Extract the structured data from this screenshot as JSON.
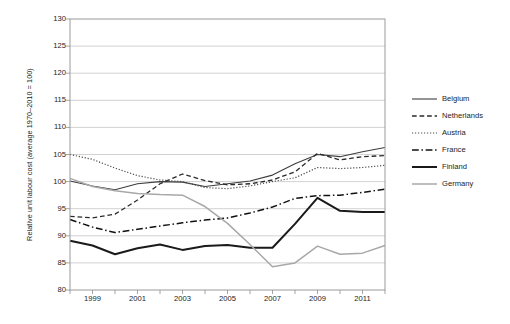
{
  "chart_data": {
    "type": "line",
    "title": "",
    "xlabel": "",
    "ylabel": "Relative unit labour cost (average 1970–2010 = 100)",
    "ylim": [
      80,
      130
    ],
    "ytick_step": 5,
    "yticks": [
      130,
      125,
      120,
      115,
      110,
      105,
      100,
      95,
      90,
      85,
      80
    ],
    "xlim": [
      1998,
      2012
    ],
    "x": [
      1998,
      1999,
      2000,
      2001,
      2002,
      2003,
      2004,
      2005,
      2006,
      2007,
      2008,
      2009,
      2010,
      2011,
      2012
    ],
    "xticks_labeled": [
      1999,
      2001,
      2003,
      2005,
      2007,
      2009,
      2011
    ],
    "xticks_all": [
      1998,
      1999,
      2000,
      2001,
      2002,
      2003,
      2004,
      2005,
      2006,
      2007,
      2008,
      2009,
      2010,
      2011,
      2012
    ],
    "grid": "horizontal",
    "legend_position": "right",
    "series": [
      {
        "name": "Belgium",
        "color": "#3d3d3d",
        "style": "solid",
        "width": 1.1,
        "values": [
          100.1,
          99.2,
          98.5,
          99.6,
          100.0,
          99.9,
          99.1,
          99.6,
          100.1,
          101.2,
          103.3,
          105.0,
          104.6,
          105.5,
          106.3
        ]
      },
      {
        "name": "Netherlands",
        "color": "#2a2a2a",
        "style": "dashed",
        "width": 1.3,
        "values": [
          93.6,
          93.3,
          94.0,
          96.6,
          99.6,
          101.4,
          100.2,
          99.4,
          99.6,
          100.3,
          101.8,
          105.2,
          104.0,
          104.6,
          104.8
        ]
      },
      {
        "name": "Austria",
        "color": "#4a4a4a",
        "style": "dotted",
        "width": 1.2,
        "values": [
          105.0,
          104.1,
          102.5,
          101.1,
          100.3,
          100.0,
          98.9,
          98.7,
          99.2,
          100.0,
          100.7,
          102.6,
          102.4,
          102.6,
          103.0
        ]
      },
      {
        "name": "France",
        "color": "#111111",
        "style": "dashdot",
        "width": 1.5,
        "values": [
          93.0,
          91.6,
          90.6,
          91.2,
          91.8,
          92.4,
          92.9,
          93.3,
          94.2,
          95.3,
          96.9,
          97.4,
          97.5,
          98.0,
          98.6
        ]
      },
      {
        "name": "Finland",
        "color": "#1a1a1a",
        "style": "solid",
        "width": 2.0,
        "values": [
          89.1,
          88.2,
          86.6,
          87.7,
          88.4,
          87.4,
          88.1,
          88.3,
          87.8,
          87.8,
          92.2,
          97.0,
          94.6,
          94.4,
          94.4
        ]
      },
      {
        "name": "Germany",
        "color": "#a8a8a8",
        "style": "solid",
        "width": 1.5,
        "values": [
          100.6,
          99.1,
          98.3,
          97.8,
          97.6,
          97.5,
          95.4,
          92.3,
          88.4,
          84.3,
          85.0,
          88.1,
          86.6,
          86.8,
          88.2
        ]
      }
    ]
  },
  "legend": {
    "items": [
      {
        "label": "Belgium"
      },
      {
        "label": "Netherlands"
      },
      {
        "label": "Austria"
      },
      {
        "label": "France"
      },
      {
        "label": "Finland"
      },
      {
        "label": "Germany"
      }
    ]
  },
  "caption": {
    "text": ""
  }
}
